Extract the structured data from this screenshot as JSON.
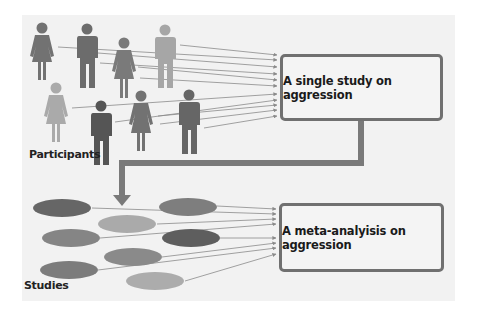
{
  "labels": {
    "participants": "Participants",
    "studies": "Studies"
  },
  "boxes": {
    "single_study": "A single study on aggression",
    "meta_analysis": "A meta-analyisis on aggression"
  },
  "colors": {
    "panel_bg": "#f2f2f2",
    "box_border": "#707070",
    "connector": "#7a7a7a",
    "lines": "#8a8a8a",
    "figure_dark": "#5e5e5e",
    "figure_mid": "#767676",
    "figure_light": "#a8a8a8",
    "ellipse_dark": "#686868",
    "ellipse_mid": "#858585",
    "ellipse_light": "#a9a9a9"
  },
  "participants": [
    {
      "type": "female",
      "shade": "mid"
    },
    {
      "type": "male",
      "shade": "mid"
    },
    {
      "type": "female",
      "shade": "mid"
    },
    {
      "type": "male",
      "shade": "light"
    },
    {
      "type": "female",
      "shade": "light"
    },
    {
      "type": "male",
      "shade": "dark"
    },
    {
      "type": "female",
      "shade": "mid"
    },
    {
      "type": "male",
      "shade": "mid"
    }
  ],
  "studies_count": 8
}
